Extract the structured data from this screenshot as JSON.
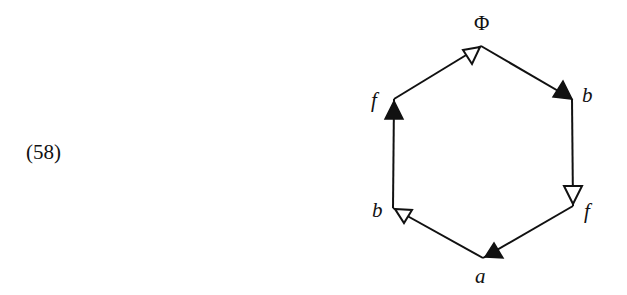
{
  "equation": {
    "number": "(58)"
  },
  "diagram": {
    "type": "directed hexagon with half-edge arrows",
    "line_color": "#111111",
    "vertices": [
      {
        "id": "top",
        "label": "Φ",
        "x": 481,
        "y": 46
      },
      {
        "id": "upper-right",
        "label": "b",
        "x": 572,
        "y": 99
      },
      {
        "id": "lower-right",
        "label": "f",
        "x": 573,
        "y": 206
      },
      {
        "id": "bottom",
        "label": "a",
        "x": 483,
        "y": 258
      },
      {
        "id": "lower-left",
        "label": "b",
        "x": 393,
        "y": 208
      },
      {
        "id": "upper-left",
        "label": "f",
        "x": 394,
        "y": 99
      }
    ],
    "edges": [
      {
        "from": "upper-left",
        "to": "top",
        "arrow": "open",
        "direction": "toward top"
      },
      {
        "from": "top",
        "to": "upper-right",
        "arrow": "filled",
        "direction": "toward upper-right"
      },
      {
        "from": "upper-right",
        "to": "lower-right",
        "arrow": "open",
        "direction": "toward lower-right"
      },
      {
        "from": "lower-right",
        "to": "bottom",
        "arrow": "filled",
        "direction": "toward bottom"
      },
      {
        "from": "bottom",
        "to": "lower-left",
        "arrow": "open",
        "direction": "toward lower-left"
      },
      {
        "from": "lower-left",
        "to": "upper-left",
        "arrow": "filled",
        "direction": "toward upper-left"
      }
    ],
    "labels": {
      "top": "Φ",
      "upper_right": "b",
      "lower_right": "f",
      "bottom": "a",
      "lower_left": "b",
      "upper_left": "f"
    }
  }
}
